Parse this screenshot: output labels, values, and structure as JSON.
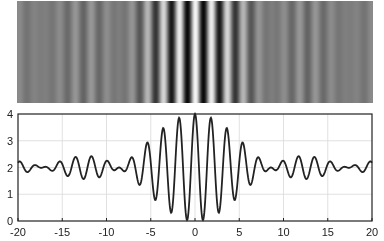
{
  "chart_data": [
    {
      "type": "heatmap",
      "title": "",
      "description": "Grayscale interference fringe pattern (intensity vs x)",
      "x_range": [
        -20,
        20
      ],
      "colormap": "gray"
    },
    {
      "type": "line",
      "title": "",
      "xlabel": "",
      "ylabel": "",
      "xlim": [
        -20,
        20
      ],
      "ylim": [
        0,
        4
      ],
      "grid": true,
      "xticks": [
        -20,
        -15,
        -10,
        -5,
        0,
        5,
        10,
        15,
        20
      ],
      "yticks": [
        0,
        1,
        2,
        3,
        4
      ],
      "model": "2 + 2*sinc(x/8.6)*cos(2*pi*x/1.8)",
      "series": [
        {
          "name": "intensity",
          "x": [
            -20,
            -15,
            -13.5,
            -12,
            -10,
            -8.5,
            -7,
            -5.4,
            -3.5,
            -1.8,
            0,
            1.8,
            3.5,
            5.4,
            7,
            8.5,
            10,
            12,
            13.5,
            15,
            20
          ],
          "values": [
            2.0,
            2.3,
            2.4,
            2.35,
            2.15,
            1.95,
            2.4,
            2.95,
            3.4,
            3.8,
            4.0,
            3.8,
            3.4,
            2.95,
            2.4,
            1.95,
            2.15,
            2.35,
            2.4,
            2.3,
            2.0
          ]
        }
      ]
    }
  ],
  "axis": {
    "xtick_labels": [
      "-20",
      "-15",
      "-10",
      "-5",
      "0",
      "5",
      "10",
      "15",
      "20"
    ],
    "ytick_labels": [
      "0",
      "1",
      "2",
      "3",
      "4"
    ]
  },
  "colors": {
    "line": "#222222",
    "grid": "#d9d9d9",
    "axes": "#222222"
  }
}
